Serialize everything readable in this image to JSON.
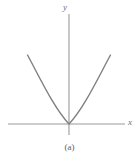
{
  "figure": {
    "caption": "(a)",
    "background_color": "#ffffff",
    "width": 139,
    "height": 163
  },
  "axes": {
    "x_label": "x",
    "y_label": "y",
    "axis_color": "#9a9a9a",
    "x_axis": {
      "x_start": 8,
      "x_end": 125,
      "y": 124
    },
    "y_axis": {
      "x": 69,
      "y_start": 14,
      "y_end": 135
    },
    "origin": {
      "x": 69,
      "y": 124
    }
  },
  "chart_data": {
    "type": "line",
    "title": "",
    "subtitle": "",
    "xlabel": "x",
    "ylabel": "y",
    "caption": "(a)",
    "grid": false,
    "legend": false,
    "legend_position": "none",
    "xlim": [
      -3,
      3
    ],
    "ylim": [
      0,
      4.5
    ],
    "xticks": [],
    "yticks": [],
    "annotations": [],
    "series": [
      {
        "name": "parabola",
        "equation": "y = x^2 / 2",
        "color": "#808080",
        "line_width": 1.4,
        "x": [
          -2.8,
          -2.4,
          -2.0,
          -1.6,
          -1.2,
          -0.8,
          -0.4,
          0.0,
          0.4,
          0.8,
          1.2,
          1.6,
          2.0,
          2.4,
          2.6
        ],
        "values": [
          3.92,
          2.88,
          2.0,
          1.28,
          0.72,
          0.32,
          0.08,
          0.0,
          0.08,
          0.32,
          0.72,
          1.28,
          2.0,
          2.88,
          3.38
        ]
      }
    ],
    "curve_path": "M 27.5,55 C 40,78 54,108 69,124 C 84,108 98,78 110.5,55",
    "vertex": {
      "x": 0,
      "y": 0
    },
    "opens": "upward",
    "touches_x_axis_at_vertex": true
  }
}
